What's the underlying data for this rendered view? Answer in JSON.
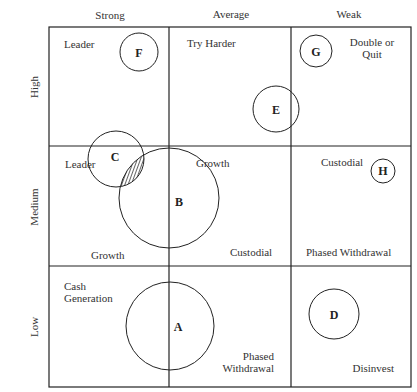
{
  "columns": [
    {
      "label": "Strong"
    },
    {
      "label": "Average"
    },
    {
      "label": "Weak"
    }
  ],
  "rows": [
    {
      "label": "High"
    },
    {
      "label": "Medium"
    },
    {
      "label": "Low"
    }
  ],
  "cells": {
    "high_strong": [
      "Leader"
    ],
    "high_average": [
      "Try Harder"
    ],
    "high_weak": [
      "Double or",
      "Quit"
    ],
    "medium_strong_top": [
      "Leader"
    ],
    "medium_strong_bottom": [
      "Growth"
    ],
    "medium_average_top": [
      "Growth"
    ],
    "medium_average_bottom": [
      "Custodial"
    ],
    "medium_weak_top": [
      "Custodial"
    ],
    "medium_weak_bottom": [
      "Phased Withdrawal"
    ],
    "low_strong": [
      "Cash",
      "Generation"
    ],
    "low_average": [
      "Phased",
      "Withdrawal"
    ],
    "low_weak": [
      "Disinvest"
    ]
  },
  "bubbles": [
    {
      "id": "A",
      "label": "A"
    },
    {
      "id": "B",
      "label": "B"
    },
    {
      "id": "C",
      "label": "C"
    },
    {
      "id": "D",
      "label": "D"
    },
    {
      "id": "E",
      "label": "E"
    },
    {
      "id": "F",
      "label": "F"
    },
    {
      "id": "G",
      "label": "G"
    },
    {
      "id": "H",
      "label": "H"
    }
  ]
}
